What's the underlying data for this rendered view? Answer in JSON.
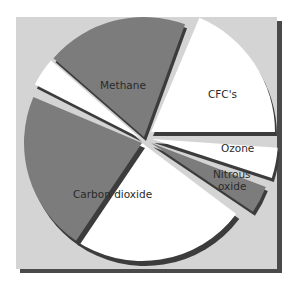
{
  "colors": {
    "page_background": "#ffffff",
    "panel": "#d4d4d4",
    "panel_shadow": "#4a4a4a",
    "slice_gray": "#7c7c7c",
    "slice_white": "#ffffff",
    "slice_edge": "#3c3c3c",
    "label_text": "#2a2a2a"
  },
  "chart_data": {
    "type": "pie",
    "title": "",
    "style": "exploded 3D pie with drop shadow, alternating gray/white slices",
    "slices": [
      {
        "label": "Carbon dioxide",
        "value": 49,
        "start_deg": 37,
        "end_deg": 203,
        "fill": "mixed gray/white"
      },
      {
        "label": "",
        "value": 4,
        "start_deg": 207,
        "end_deg": 221,
        "fill": "white"
      },
      {
        "label": "Methane",
        "value": 19,
        "start_deg": 222,
        "end_deg": 290,
        "fill": "gray"
      },
      {
        "label": "CFC's",
        "value": 19,
        "start_deg": 293,
        "end_deg": 360,
        "fill": "white"
      },
      {
        "label": "Ozone",
        "value": 4,
        "start_deg": 4,
        "end_deg": 18,
        "fill": "white"
      },
      {
        "label": "Nitrous oxide",
        "value": 4,
        "start_deg": 21,
        "end_deg": 34,
        "fill": "gray"
      }
    ],
    "labels": [
      "Methane",
      "CFC's",
      "Ozone",
      "Nitrous oxide",
      "Carbon dioxide"
    ],
    "legend": "none (labels drawn on slices)"
  },
  "labels": {
    "methane": "Methane",
    "cfcs": "CFC's",
    "ozone": "Ozone",
    "nitrous_1": "Nitrous",
    "nitrous_2": "oxide",
    "co2": "Carbon dioxide"
  }
}
